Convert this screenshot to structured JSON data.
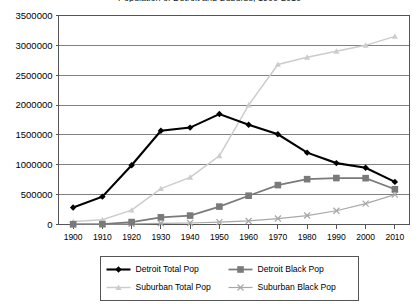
{
  "chart_data": {
    "type": "line",
    "title": "Population of Detroit and Suburbs, 1900-2010",
    "xlabel": "",
    "ylabel": "",
    "x": [
      1900,
      1910,
      1920,
      1930,
      1940,
      1950,
      1960,
      1970,
      1980,
      1990,
      2000,
      2010
    ],
    "xtick_labels": [
      "1900",
      "1910",
      "1920",
      "1930",
      "1940",
      "1950",
      "1960",
      "1970",
      "1980",
      "1990",
      "2000",
      "2010"
    ],
    "ylim": [
      0,
      3500000
    ],
    "ytick_values": [
      0,
      500000,
      1000000,
      1500000,
      2000000,
      2500000,
      3000000,
      3500000
    ],
    "ytick_labels": [
      "0",
      "500000",
      "1000000",
      "1500000",
      "2000000",
      "2500000",
      "3000000",
      "3500000"
    ],
    "grid": true,
    "legend_position": "bottom",
    "series": [
      {
        "name": "Detroit Total Pop",
        "marker": "diamond",
        "color": "#000000",
        "values": [
          285000,
          466000,
          993000,
          1569000,
          1623000,
          1850000,
          1670000,
          1511000,
          1203000,
          1028000,
          951000,
          713000
        ]
      },
      {
        "name": "Detroit Black Pop",
        "marker": "square",
        "color": "#7a7a7a",
        "values": [
          4000,
          6000,
          41000,
          120000,
          149000,
          300000,
          482000,
          660000,
          759000,
          778000,
          776000,
          590000
        ]
      },
      {
        "name": "Suburban Total Pop",
        "marker": "triangle",
        "color": "#cccccc",
        "values": [
          50000,
          80000,
          240000,
          600000,
          790000,
          1150000,
          2000000,
          2680000,
          2800000,
          2900000,
          3000000,
          3150000
        ]
      },
      {
        "name": "Suburban Black Pop",
        "marker": "x",
        "color": "#a8a8a8",
        "values": [
          5000,
          7000,
          12000,
          20000,
          25000,
          40000,
          60000,
          100000,
          150000,
          230000,
          350000,
          500000
        ]
      }
    ]
  }
}
